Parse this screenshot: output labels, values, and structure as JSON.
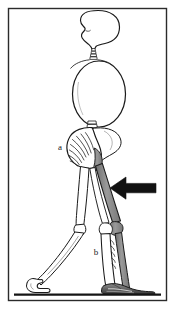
{
  "figure": {
    "background_color": "#ffffff",
    "border_color": "#2b2b2b",
    "ink_color": "#1a1a1a",
    "bone_fill_color": "#ffffff",
    "shaded_bone_color": "#8f8f8f",
    "shaded_bone_dark_color": "#6e6e6e",
    "arrow_color": "#111111",
    "ground_color": "#141414"
  },
  "labels": [
    {
      "id": "a",
      "text": "a",
      "x": 60,
      "y": 150,
      "target": "pelvis"
    },
    {
      "id": "b",
      "text": "b",
      "x": 96,
      "y": 255,
      "target": "tibia"
    }
  ],
  "annotations": {
    "arrow": {
      "name": "knee-pointer-arrow",
      "direction": "left",
      "x": 110,
      "y": 188,
      "length": 46,
      "color": "#111111"
    }
  },
  "parts": [
    {
      "id": "skull",
      "label": "skull"
    },
    {
      "id": "cervical-spine",
      "label": "cervical spine"
    },
    {
      "id": "ribcage",
      "label": "rib cage"
    },
    {
      "id": "lumbar-spine",
      "label": "lumbar spine"
    },
    {
      "id": "pelvis",
      "label": "pelvis"
    },
    {
      "id": "femur-near",
      "label": "near femur"
    },
    {
      "id": "femur-far",
      "label": "far femur"
    },
    {
      "id": "tibia-near",
      "label": "near tibia"
    },
    {
      "id": "tibia-far",
      "label": "far tibia"
    },
    {
      "id": "foot-near",
      "label": "near foot"
    },
    {
      "id": "foot-far",
      "label": "far foot"
    },
    {
      "id": "ground-line",
      "label": "ground line"
    }
  ]
}
